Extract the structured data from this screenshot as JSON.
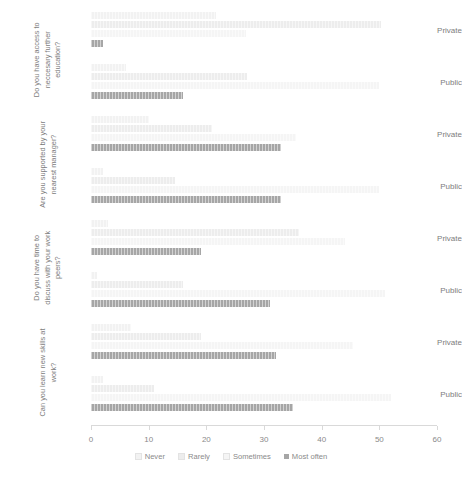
{
  "chart_data": {
    "type": "bar",
    "title": "",
    "subtitle": "",
    "orientation": "horizontal",
    "xlabel": "",
    "ylabel": "",
    "xlim": [
      0,
      60
    ],
    "xticks": [
      0,
      10,
      20,
      30,
      40,
      50,
      60
    ],
    "xticklabels": [
      "0",
      "10",
      "20",
      "30",
      "40",
      "50",
      "60"
    ],
    "grid": false,
    "legend_position": "bottom",
    "legend_entries": [
      "Never",
      "Rarely",
      "Sometimes",
      "Most often"
    ],
    "series": [
      {
        "name": "Never",
        "color": "#f2f2f2",
        "values": [
          21.7,
          6,
          10,
          2,
          3,
          1,
          7,
          2
        ]
      },
      {
        "name": "Rarely",
        "color": "#ededed",
        "values": [
          50.3,
          27,
          21,
          14.5,
          36,
          16,
          19,
          11
        ]
      },
      {
        "name": "Sometimes",
        "color": "#f5f5f5",
        "values": [
          26.8,
          50,
          35.5,
          50,
          44,
          51,
          45.5,
          52
        ]
      },
      {
        "name": "Most often",
        "color": "#a6a6a6",
        "values": [
          2,
          16,
          33,
          33,
          19,
          31,
          32,
          35
        ]
      }
    ],
    "categories": [
      "Private",
      "Public",
      "Private",
      "Public",
      "Private",
      "Public",
      "Private",
      "Public"
    ],
    "groups": [
      {
        "question": "Do you have access to neccesary further education?",
        "rows": [
          {
            "label": "Private",
            "Never": 21.7,
            "Rarely": 50.3,
            "Sometimes": 26.8,
            "Most often": 2
          },
          {
            "label": "Public",
            "Never": 6,
            "Rarely": 27,
            "Sometimes": 50,
            "Most often": 16
          }
        ]
      },
      {
        "question": "Are you supported by your nearest manager?",
        "rows": [
          {
            "label": "Private",
            "Never": 10,
            "Rarely": 21,
            "Sometimes": 35.5,
            "Most often": 33
          },
          {
            "label": "Public",
            "Never": 2,
            "Rarely": 14.5,
            "Sometimes": 50,
            "Most often": 33
          }
        ]
      },
      {
        "question": "Do you have time to discuss with your work peers?",
        "rows": [
          {
            "label": "Private",
            "Never": 3,
            "Rarely": 36,
            "Sometimes": 44,
            "Most often": 19
          },
          {
            "label": "Public",
            "Never": 1,
            "Rarely": 16,
            "Sometimes": 51,
            "Most often": 31
          }
        ]
      },
      {
        "question": "Can you learn new skills at work?",
        "rows": [
          {
            "label": "Private",
            "Never": 7,
            "Rarely": 19,
            "Sometimes": 45.5,
            "Most often": 32
          },
          {
            "label": "Public",
            "Never": 2,
            "Rarely": 11,
            "Sometimes": 52,
            "Most often": 35
          }
        ]
      }
    ]
  },
  "legend": {
    "items": [
      {
        "label": "Never",
        "color": "#f2f2f2"
      },
      {
        "label": "Rarely",
        "color": "#ededed"
      },
      {
        "label": "Sometimes",
        "color": "#f5f5f5"
      },
      {
        "label": "Most often",
        "color": "#a6a6a6"
      }
    ]
  }
}
